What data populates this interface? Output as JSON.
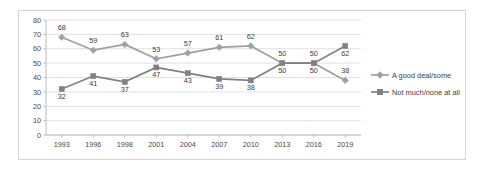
{
  "chart_data": {
    "type": "line",
    "title": "",
    "xlabel": "",
    "ylabel": "",
    "ylim": [
      0,
      80
    ],
    "ytick_step": 10,
    "grid": true,
    "legend_position": "right",
    "categories": [
      "1993",
      "1996",
      "1998",
      "2001",
      "2004",
      "2007",
      "2010",
      "2013",
      "2016",
      "2019"
    ],
    "yticks": [
      "0",
      "10",
      "20",
      "30",
      "40",
      "50",
      "60",
      "70",
      "80"
    ],
    "series": [
      {
        "name": "A good deal/some",
        "marker": "diamond",
        "color": "#a0a0a0",
        "values": [
          68,
          59,
          63,
          53,
          57,
          61,
          62,
          50,
          50,
          38
        ],
        "label_positions": [
          "above",
          "above",
          "above",
          "above",
          "above",
          "above",
          "above",
          "above",
          "above",
          "above"
        ]
      },
      {
        "name": "Not much/none at all",
        "marker": "square",
        "color": "#808080",
        "values": [
          32,
          41,
          37,
          47,
          43,
          39,
          38,
          50,
          50,
          62
        ],
        "label_positions": [
          "below",
          "below",
          "below",
          "below",
          "below",
          "below",
          "below",
          "below",
          "below",
          "below"
        ]
      }
    ]
  },
  "legend": {
    "items": [
      {
        "label": "A good deal/some",
        "marker": "diamond",
        "color": "#a0a0a0"
      },
      {
        "label": "Not much/none at all",
        "marker": "square",
        "color": "#808080"
      }
    ]
  },
  "colors": {
    "series_a": "#a0a0a0",
    "series_b": "#808080",
    "gridline": "#d9d9d9",
    "axis": "#b4b4b4",
    "frame_border": "#d4d4d4",
    "text": "#4a4a4a",
    "background": "#ffffff"
  }
}
